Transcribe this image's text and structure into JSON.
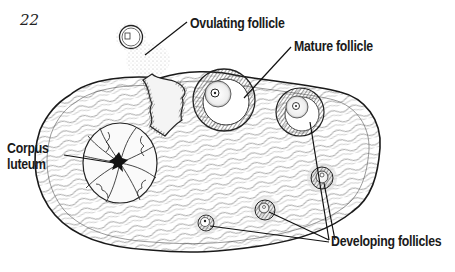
{
  "page_number": "22",
  "labels": {
    "ovulating_follicle": "Ovulating follicle",
    "mature_follicle": "Mature follicle",
    "corpus_luteum_line1": "Corpus",
    "corpus_luteum_line2": "luteum",
    "developing_follicles": "Developing follicles"
  },
  "colors": {
    "ink": "#1a1a1a",
    "background": "#ffffff",
    "hatch": "#555555"
  }
}
